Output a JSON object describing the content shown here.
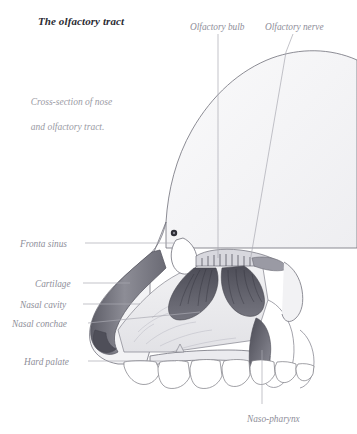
{
  "figure": {
    "title": "The olfactory tract",
    "caption_line1": "Cross-section of nose",
    "caption_line2": "and olfactory tract.",
    "background_color": "#ffffff",
    "title_color": "#2b2b33",
    "label_color": "#8e8e99",
    "leader_line_color": "#a9a9b2",
    "outline_color": "#6e6e78",
    "skull_fill": "#f4f4f6",
    "tissue_fill": "#ededf0",
    "cartilage_fill": "#7c7c86",
    "conchae_fill": "#5e5e68",
    "nasopharynx_fill": "#55555f",
    "tooth_fill": "#ffffff"
  },
  "labels": [
    {
      "id": "olfactory-bulb",
      "text": "Olfactory bulb",
      "x": 190,
      "y": 22,
      "align": "left"
    },
    {
      "id": "olfactory-nerve",
      "text": "Olfactory nerve",
      "x": 265,
      "y": 22,
      "align": "left"
    },
    {
      "id": "frontal-sinus",
      "text": "Fronta sinus",
      "x": 20,
      "y": 239,
      "align": "left"
    },
    {
      "id": "cartilage",
      "text": "Cartilage",
      "x": 35,
      "y": 279,
      "align": "left"
    },
    {
      "id": "nasal-cavity",
      "text": "Nasal cavity",
      "x": 20,
      "y": 300,
      "align": "left"
    },
    {
      "id": "nasal-conchae",
      "text": "Nasal conchae",
      "x": 12,
      "y": 319,
      "align": "left"
    },
    {
      "id": "hard-palate",
      "text": "Hard palate",
      "x": 24,
      "y": 357,
      "align": "left"
    },
    {
      "id": "naso-pharynx",
      "text": "Naso-pharynx",
      "x": 247,
      "y": 414,
      "align": "left"
    }
  ],
  "leader_lines": [
    {
      "id": "leader-olfactory-bulb",
      "points": "218,34 218,258"
    },
    {
      "id": "leader-olfactory-nerve",
      "points": "293,34 286,52 250,262"
    },
    {
      "id": "leader-frontal-sinus",
      "points": "85,243 175,243"
    },
    {
      "id": "leader-cartilage",
      "points": "83,283 130,283"
    },
    {
      "id": "leader-nasal-cavity",
      "points": "83,304 140,304"
    },
    {
      "id": "leader-nasal-conchae",
      "points": "88,323 200,312"
    },
    {
      "id": "leader-hard-palate",
      "points": "88,361 176,361"
    },
    {
      "id": "leader-naso-pharynx",
      "points": "262,404 262,350"
    }
  ],
  "anatomy": {
    "skull_dome": "Large curved cranial vault outline, light gray fill",
    "nose_bridge": "Dark gray cartilaginous nasal dorsum and tip",
    "conchae": "Dark shaded turbinate scrolls with fine branching striations",
    "cribriform_plate": "Small serrated plate above the conchae",
    "hard_palate": "Horizontal bony shelf above the tooth row",
    "teeth_count": 7,
    "foramen_dot": "Small dark circular foramen near the orbit"
  }
}
